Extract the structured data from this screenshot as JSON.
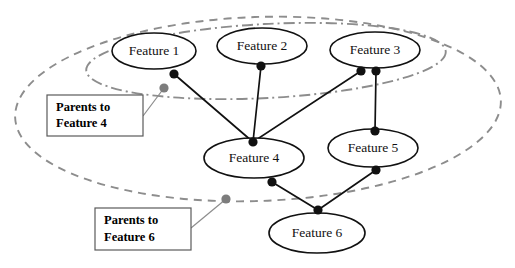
{
  "figure": {
    "type": "bayesian-network-diagram",
    "background_color": "#ffffff"
  },
  "nodes": [
    {
      "id": "feature1",
      "label": "Feature 1",
      "cx": 154,
      "cy": 51,
      "rx": 42,
      "ry": 18
    },
    {
      "id": "feature2",
      "label": "Feature 2",
      "cx": 262,
      "cy": 46,
      "rx": 45,
      "ry": 18
    },
    {
      "id": "feature3",
      "label": "Feature 3",
      "cx": 375,
      "cy": 50,
      "rx": 45,
      "ry": 18
    },
    {
      "id": "feature4",
      "label": "Feature 4",
      "cx": 254,
      "cy": 158,
      "rx": 50,
      "ry": 20
    },
    {
      "id": "feature5",
      "label": "Feature 5",
      "cx": 373,
      "cy": 148,
      "rx": 45,
      "ry": 19
    },
    {
      "id": "feature6",
      "label": "Feature 6",
      "cx": 317,
      "cy": 233,
      "rx": 48,
      "ry": 20
    }
  ],
  "ports": [
    {
      "id": "p-f1-out",
      "cx": 174,
      "cy": 74,
      "r": 4.6
    },
    {
      "id": "p-f2-out",
      "cx": 261,
      "cy": 66,
      "r": 4.6
    },
    {
      "id": "p-f3-out-left",
      "cx": 361,
      "cy": 71,
      "r": 4.6
    },
    {
      "id": "p-f3-out-right",
      "cx": 376,
      "cy": 71,
      "r": 4.6
    },
    {
      "id": "p-f4-in",
      "cx": 253,
      "cy": 142,
      "r": 4.6
    },
    {
      "id": "p-f4-out",
      "cx": 272,
      "cy": 182,
      "r": 4.6
    },
    {
      "id": "p-f5-in",
      "cx": 375,
      "cy": 131,
      "r": 4.6
    },
    {
      "id": "p-f5-out",
      "cx": 376,
      "cy": 170,
      "r": 4.6
    },
    {
      "id": "p-f6-in",
      "cx": 318,
      "cy": 210,
      "r": 4.6
    }
  ],
  "edges": [
    {
      "id": "edge-f1-f4",
      "from": "feature1",
      "to": "feature4",
      "x1": 174,
      "y1": 74,
      "x2": 253,
      "y2": 142
    },
    {
      "id": "edge-f2-f4",
      "from": "feature2",
      "to": "feature4",
      "x1": 261,
      "y1": 66,
      "x2": 253,
      "y2": 142
    },
    {
      "id": "edge-f3-f4",
      "from": "feature3",
      "to": "feature4",
      "x1": 361,
      "y1": 71,
      "x2": 253,
      "y2": 142
    },
    {
      "id": "edge-f3-f5",
      "from": "feature3",
      "to": "feature5",
      "x1": 376,
      "y1": 71,
      "x2": 375,
      "y2": 131
    },
    {
      "id": "edge-f4-f6",
      "from": "feature4",
      "to": "feature6",
      "x1": 272,
      "y1": 182,
      "x2": 318,
      "y2": 210
    },
    {
      "id": "edge-f5-f6",
      "from": "feature5",
      "to": "feature6",
      "x1": 376,
      "y1": 170,
      "x2": 318,
      "y2": 210
    }
  ],
  "groups": [
    {
      "id": "parents-to-feature-6-group",
      "style": "dashed",
      "color": "#8d8d8d",
      "cx": 258,
      "cy": 109,
      "rx": 243,
      "ry": 92,
      "rotation": -2
    },
    {
      "id": "parents-to-feature-4-group",
      "style": "dash-dot",
      "color": "#8d8d8d",
      "cx": 266,
      "cy": 61,
      "rx": 180,
      "ry": 37,
      "rotation": -3
    }
  ],
  "annotations": [
    {
      "id": "annot-parents-feature-4",
      "line1": "Parents to",
      "line2": "Feature 4",
      "box": {
        "x": 47,
        "y": 95,
        "w": 96,
        "h": 41
      },
      "marker": {
        "cx": 164,
        "cy": 88,
        "r": 4.6
      },
      "leader": {
        "x1": 143,
        "y1": 116,
        "x2": 164,
        "y2": 88
      }
    },
    {
      "id": "annot-parents-feature-6",
      "line1": "Parents to",
      "line2": "Feature 6",
      "box": {
        "x": 95,
        "y": 208,
        "w": 96,
        "h": 42
      },
      "marker": {
        "cx": 226,
        "cy": 199,
        "r": 4.6
      },
      "leader": {
        "x1": 191,
        "y1": 228,
        "x2": 226,
        "y2": 199
      }
    }
  ],
  "colors": {
    "node_stroke": "#111111",
    "edge": "#111111",
    "group_stroke": "#8d8d8d",
    "marker_gray": "#7d7d7d",
    "annotation_box_stroke": "#5a5a5a"
  }
}
